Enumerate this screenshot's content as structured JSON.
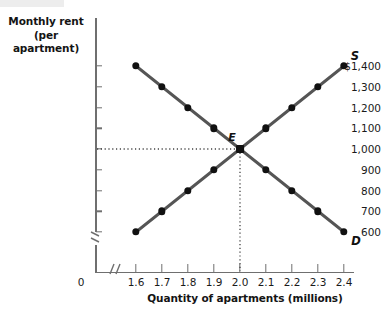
{
  "figure": {
    "background_color": "#ffffff",
    "axis_color": "#6f6f6f",
    "curve_color": "#555555",
    "point_color": "#111111",
    "guide_color": "#444444"
  },
  "axes": {
    "y_title_line1": "Monthly rent",
    "y_title_line2": "(per apartment)",
    "x_title": "Quantity of apartments (millions)",
    "origin_label": "0",
    "y_tick_labels": [
      "$1,400",
      "1,300",
      "1,200",
      "1,100",
      "1,000",
      "900",
      "800",
      "700",
      "600"
    ],
    "y_tick_values": [
      1400,
      1300,
      1200,
      1100,
      1000,
      900,
      800,
      700,
      600
    ],
    "x_tick_labels": [
      "1.6",
      "1.7",
      "1.8",
      "1.9",
      "2.0",
      "2.1",
      "2.2",
      "2.3",
      "2.4"
    ],
    "x_tick_values": [
      1.6,
      1.7,
      1.8,
      1.9,
      2.0,
      2.1,
      2.2,
      2.3,
      2.4
    ],
    "y_axis_break": true,
    "x_axis_break": true
  },
  "annotations": {
    "supply_label": "S",
    "demand_label": "D",
    "equilibrium_label": "E",
    "equilibrium_x": 2.0,
    "equilibrium_y": 1000
  },
  "chart_data": {
    "type": "line",
    "title": "",
    "subtitle": "",
    "xlabel": "Quantity of apartments (millions)",
    "ylabel": "Monthly rent (per apartment)",
    "xlim": [
      1.6,
      2.4
    ],
    "ylim": [
      600,
      1400
    ],
    "grid": false,
    "legend_position": "inline-curve-labels",
    "x": [
      1.6,
      1.7,
      1.8,
      1.9,
      2.0,
      2.1,
      2.2,
      2.3,
      2.4
    ],
    "series": [
      {
        "name": "D",
        "label": "Demand",
        "markers": true,
        "values": [
          1400,
          1300,
          1200,
          1100,
          1000,
          900,
          800,
          700,
          600
        ]
      },
      {
        "name": "S",
        "label": "Supply",
        "markers": true,
        "values": [
          600,
          700,
          800,
          900,
          1000,
          1100,
          1200,
          1300,
          1400
        ]
      }
    ],
    "annotations": [
      {
        "text": "E",
        "x": 2.0,
        "y": 1000,
        "note": "equilibrium point"
      },
      {
        "text": "S",
        "x": 2.4,
        "y": 1400,
        "note": "supply curve label"
      },
      {
        "text": "D",
        "x": 2.4,
        "y": 600,
        "note": "demand curve label"
      }
    ],
    "guides": [
      {
        "type": "horizontal",
        "y": 1000,
        "style": "dotted",
        "from_axis": "y"
      },
      {
        "type": "vertical",
        "x": 2.0,
        "style": "dotted",
        "from_axis": "x"
      }
    ]
  }
}
